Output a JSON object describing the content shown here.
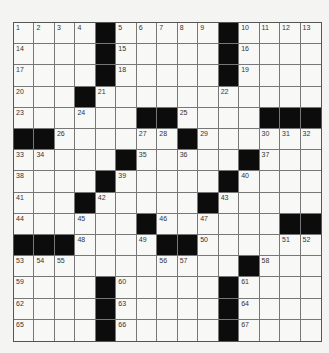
{
  "puzzle": {
    "rows": 15,
    "cols": 15,
    "layout": [
      "....#.....#....",
      "....#.....#....",
      "....#.....#....",
      "...#...........",
      "......##....###",
      "##......#......",
      ".....#.....#...",
      "....#.....#....",
      "...#.....#.....",
      "......#......##",
      "###....##......",
      "...........#...",
      "....#.....#....",
      "....#.....#....",
      "....#.....#...."
    ],
    "numbers": [
      [
        1,
        2,
        3,
        4,
        0,
        5,
        6,
        7,
        8,
        9,
        0,
        10,
        11,
        12,
        13
      ],
      [
        14,
        0,
        0,
        0,
        0,
        15,
        0,
        0,
        0,
        0,
        0,
        16,
        0,
        0,
        0
      ],
      [
        17,
        0,
        0,
        0,
        0,
        18,
        0,
        0,
        0,
        0,
        0,
        19,
        0,
        0,
        0
      ],
      [
        20,
        0,
        0,
        0,
        21,
        0,
        0,
        0,
        0,
        0,
        22,
        0,
        0,
        0,
        0
      ],
      [
        23,
        0,
        0,
        24,
        0,
        0,
        0,
        0,
        25,
        0,
        0,
        0,
        0,
        0,
        0
      ],
      [
        0,
        0,
        26,
        0,
        0,
        0,
        27,
        28,
        0,
        29,
        0,
        0,
        30,
        31,
        32
      ],
      [
        33,
        34,
        0,
        0,
        0,
        0,
        35,
        0,
        36,
        0,
        0,
        0,
        37,
        0,
        0
      ],
      [
        38,
        0,
        0,
        0,
        0,
        39,
        0,
        0,
        0,
        0,
        0,
        40,
        0,
        0,
        0
      ],
      [
        41,
        0,
        0,
        0,
        42,
        0,
        0,
        0,
        0,
        0,
        43,
        0,
        0,
        0,
        0
      ],
      [
        44,
        0,
        0,
        45,
        0,
        0,
        0,
        46,
        0,
        47,
        0,
        0,
        0,
        0,
        0
      ],
      [
        0,
        0,
        0,
        48,
        0,
        0,
        49,
        0,
        0,
        50,
        0,
        0,
        0,
        51,
        52
      ],
      [
        53,
        54,
        55,
        0,
        0,
        0,
        0,
        56,
        57,
        0,
        0,
        0,
        58,
        0,
        0
      ],
      [
        59,
        0,
        0,
        0,
        0,
        60,
        0,
        0,
        0,
        0,
        0,
        61,
        0,
        0,
        0
      ],
      [
        62,
        0,
        0,
        0,
        0,
        63,
        0,
        0,
        0,
        0,
        0,
        64,
        0,
        0,
        0
      ],
      [
        65,
        0,
        0,
        0,
        0,
        66,
        0,
        0,
        0,
        0,
        0,
        67,
        0,
        0,
        0
      ]
    ]
  },
  "colors": {
    "black_square": "#0c0c0c",
    "paper": "#f7f7f5"
  }
}
